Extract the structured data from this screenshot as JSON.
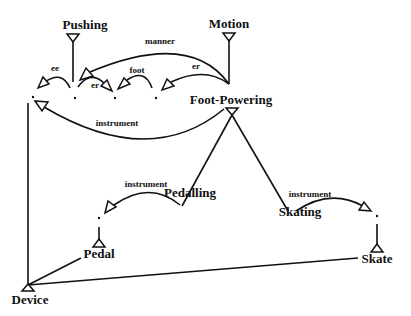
{
  "diagram": {
    "nodes": [
      {
        "id": "pushing",
        "label": "Pushing",
        "x": 85,
        "y": 29
      },
      {
        "id": "motion",
        "label": "Motion",
        "x": 229,
        "y": 28
      },
      {
        "id": "foot_powering",
        "label": "Foot-Powering",
        "x": 231,
        "y": 104
      },
      {
        "id": "pedalling",
        "label": "Pedalling",
        "x": 190,
        "y": 197
      },
      {
        "id": "skating",
        "label": "Skating",
        "x": 300,
        "y": 216
      },
      {
        "id": "pedal",
        "label": "Pedal",
        "x": 99,
        "y": 258
      },
      {
        "id": "skate",
        "label": "Skate",
        "x": 377,
        "y": 263
      },
      {
        "id": "device",
        "label": "Device",
        "x": 30,
        "y": 304
      }
    ],
    "edge_labels": [
      {
        "id": "manner",
        "label": "manner",
        "x": 160,
        "y": 44
      },
      {
        "id": "ee",
        "label": "ee",
        "x": 55,
        "y": 71
      },
      {
        "id": "er1",
        "label": "er",
        "x": 95,
        "y": 88
      },
      {
        "id": "foot",
        "label": "foot",
        "x": 137,
        "y": 73
      },
      {
        "id": "er2",
        "label": "er",
        "x": 196,
        "y": 69
      },
      {
        "id": "instrument1",
        "label": "instrument",
        "x": 117,
        "y": 126
      },
      {
        "id": "instrument2",
        "label": "instrument",
        "x": 146,
        "y": 187
      },
      {
        "id": "instrument3",
        "label": "instrument",
        "x": 310,
        "y": 197
      }
    ]
  }
}
